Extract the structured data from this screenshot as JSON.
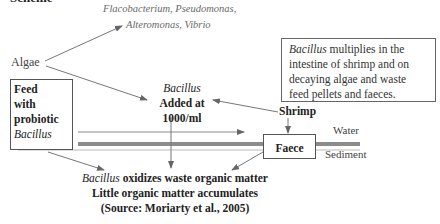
{
  "top_fragment": "Scheme",
  "bacteria": {
    "line1": "Flacobacterium, Pseudomonas,",
    "line2": "Alteromonas, Vibrio"
  },
  "algae_label": "Algae",
  "feed_box": {
    "line1": "Feed",
    "line2": "with",
    "line3": "probiotic",
    "line4": "Bacillus"
  },
  "bacillus_added": {
    "line1": "Bacillus",
    "line2": "Added at",
    "line3": "1000/ml"
  },
  "info_box": {
    "italic_word": "Bacillus",
    "line1_rest": " multiplies in the",
    "line2": "intestine of shrimp and on",
    "line3": "decaying algae and waste",
    "line4": "feed pellets and faeces."
  },
  "shrimp_label": "Shrimp",
  "faece_label": "Faece",
  "water_label": "Water",
  "sediment_label": "Sediment",
  "bottom": {
    "italic_word": "Bacillus",
    "line1_rest": " oxidizes waste organic matter",
    "line2": "Little organic matter accumulates",
    "line3": "(Source: Moriarty et al., 2005)"
  },
  "colors": {
    "arrow": "#777777",
    "water_bar": "#8c8c8c",
    "text": "#222222",
    "bacteria_text": "#6a6a6a"
  }
}
